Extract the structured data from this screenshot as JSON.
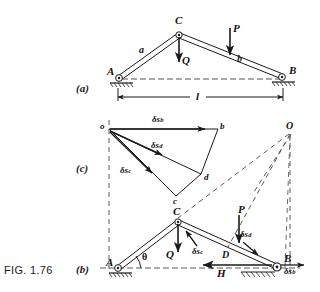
{
  "figure": {
    "caption": "FIG. 1.76",
    "panels": [
      {
        "id": "a",
        "label": "(a)"
      },
      {
        "id": "c",
        "label": "(c)"
      },
      {
        "id": "b",
        "label": "(b)"
      }
    ]
  },
  "panel_a": {
    "joints": [
      {
        "name": "A",
        "label": "A"
      },
      {
        "name": "B",
        "label": "B"
      },
      {
        "name": "C",
        "label": "C"
      }
    ],
    "members": [
      {
        "name": "member-a",
        "label": "a"
      },
      {
        "name": "member-b",
        "label": "b"
      }
    ],
    "forces": [
      {
        "name": "load-P",
        "label": "P",
        "direction": "down"
      },
      {
        "name": "load-Q",
        "label": "Q",
        "direction": "down"
      }
    ],
    "dimension": {
      "label": "l"
    }
  },
  "panel_c": {
    "title": "displacement-polygon",
    "nodes": [
      {
        "name": "pole-o",
        "label": "o"
      },
      {
        "name": "node-b",
        "label": "b"
      },
      {
        "name": "node-d",
        "label": "d"
      },
      {
        "name": "node-c",
        "label": "c"
      },
      {
        "name": "centre-O",
        "label": "O"
      }
    ],
    "vectors": [
      {
        "name": "delta-s-b",
        "prefix": "δs",
        "sub": "b"
      },
      {
        "name": "delta-s-d",
        "prefix": "δs",
        "sub": "d"
      },
      {
        "name": "delta-s-c",
        "prefix": "δs",
        "sub": "c"
      }
    ]
  },
  "panel_b": {
    "joints": [
      {
        "name": "A",
        "label": "A"
      },
      {
        "name": "B",
        "label": "B"
      },
      {
        "name": "C",
        "label": "C"
      },
      {
        "name": "D",
        "label": "D"
      }
    ],
    "forces": [
      {
        "name": "load-P",
        "label": "P"
      },
      {
        "name": "load-Q",
        "label": "Q"
      },
      {
        "name": "reaction-H",
        "label": "H"
      }
    ],
    "angle": {
      "label": "θ"
    },
    "displacements": [
      {
        "name": "delta-s-c",
        "prefix": "δs",
        "sub": "c"
      },
      {
        "name": "delta-s-d",
        "prefix": "δs",
        "sub": "d"
      },
      {
        "name": "delta-s-b",
        "prefix": "δs",
        "sub": "b"
      }
    ]
  },
  "colors": {
    "ink": "#1a1a1a",
    "paper": "#ffffff",
    "dashed": "#5a5a5a"
  }
}
